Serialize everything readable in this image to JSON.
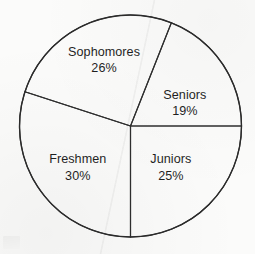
{
  "chart_data": {
    "type": "pie",
    "title": "",
    "subtitle": "",
    "xlabel": "",
    "ylabel": "",
    "legend_position": "none",
    "grid": false,
    "units": "percent",
    "data_labels": true,
    "categories": [
      "Sophomores",
      "Seniors",
      "Juniors",
      "Freshmen"
    ],
    "values": [
      26,
      19,
      25,
      30
    ],
    "slices": [
      {
        "name": "Sophomores",
        "value": 26,
        "value_label": "26%",
        "start_angle_deg": 198.0,
        "end_angle_deg": 291.6,
        "label_x_pct": 40.8,
        "label_y_pct": 23.6
      },
      {
        "name": "Seniors",
        "value": 19,
        "value_label": "19%",
        "start_angle_deg": 291.6,
        "end_angle_deg": 360.0,
        "label_x_pct": 72.5,
        "label_y_pct": 40.4
      },
      {
        "name": "Juniors",
        "value": 25,
        "value_label": "25%",
        "start_angle_deg": 0.0,
        "end_angle_deg": 90.0,
        "label_x_pct": 67.0,
        "label_y_pct": 65.8
      },
      {
        "name": "Freshmen",
        "value": 30,
        "value_label": "30%",
        "start_angle_deg": 90.0,
        "end_angle_deg": 198.0,
        "label_x_pct": 30.5,
        "label_y_pct": 65.8
      }
    ],
    "geometry": {
      "center_x": 130.5,
      "center_y": 126.0,
      "radius": 111.0
    },
    "colors": {
      "slice_fill": "#ffffff",
      "outline": "#2b2b2b",
      "text": "#1f1f1f",
      "background": "#fbfbfa"
    }
  }
}
